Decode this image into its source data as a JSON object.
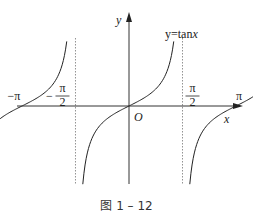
{
  "figure": {
    "function_label": "y=tanx",
    "function_name": "y=tan",
    "function_var": "x",
    "axis_x_label": "x",
    "axis_y_label": "y",
    "origin_label": "O",
    "caption": "图 1 – 12"
  },
  "chart_data": {
    "type": "line",
    "title": "y=tanx",
    "xlabel": "x",
    "ylabel": "y",
    "asymptotes": [
      "-3π/2",
      "-π/2",
      "π/2",
      "3π/2"
    ],
    "asymptote_values": [
      -4.712,
      -1.571,
      1.571,
      4.712
    ],
    "tick_labels": [
      {
        "label": "-3π/2",
        "sign": "-",
        "num": "3π",
        "den": "2",
        "value": -4.712
      },
      {
        "label": "-π",
        "value": -3.1416
      },
      {
        "label": "-π/2",
        "sign": "-",
        "num": "π",
        "den": "2",
        "value": -1.571
      },
      {
        "label": "π/2",
        "sign": "",
        "num": "π",
        "den": "2",
        "value": 1.571
      },
      {
        "label": "π",
        "value": 3.1416
      },
      {
        "label": "3π/2",
        "sign": "",
        "num": "3π",
        "den": "2",
        "value": 4.712
      }
    ],
    "branches": [
      {
        "center": -3.1416,
        "name": "branch-left"
      },
      {
        "center": 0,
        "name": "branch-center"
      },
      {
        "center": 3.1416,
        "name": "branch-right"
      }
    ],
    "xlim": [
      -6.9,
      6.4
    ],
    "ylim": [
      -4.6,
      3.8
    ]
  },
  "colors": {
    "curve": "#222222",
    "axis": "#333333",
    "asymptote": "#777777"
  }
}
